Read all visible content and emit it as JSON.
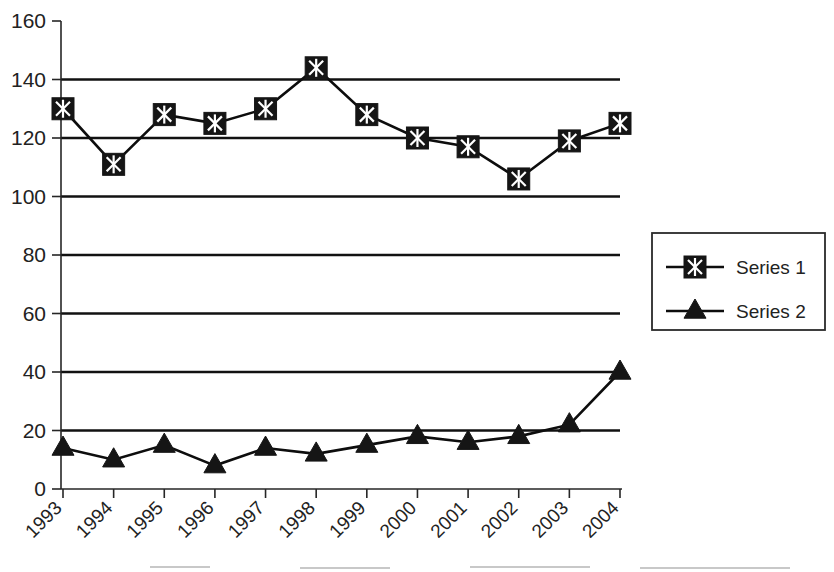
{
  "chart_data": {
    "type": "line",
    "title": "",
    "xlabel": "",
    "ylabel": "",
    "categories": [
      "1993",
      "1994",
      "1995",
      "1996",
      "1997",
      "1998",
      "1999",
      "2000",
      "2001",
      "2002",
      "2003",
      "2004"
    ],
    "series": [
      {
        "name": "Series 1",
        "marker": "filled-square-cross",
        "values": [
          130,
          111,
          128,
          125,
          130,
          144,
          128,
          120,
          117,
          106,
          119,
          125
        ]
      },
      {
        "name": "Series 2",
        "marker": "filled-triangle",
        "values": [
          14,
          10,
          15,
          8,
          14,
          12,
          15,
          18,
          16,
          18,
          22,
          40
        ]
      }
    ],
    "ylim": [
      0,
      160
    ],
    "ytick_values": [
      0,
      20,
      40,
      60,
      80,
      100,
      120,
      140,
      160
    ],
    "ytick_labels": [
      "0",
      "20",
      "40",
      "60",
      "80",
      "100",
      "120",
      "140",
      "160"
    ],
    "gridline_values": [
      20,
      40,
      60,
      80,
      100,
      120,
      140
    ],
    "grid": true,
    "xtick_rotation_degrees": -45,
    "legend": {
      "position": "right",
      "entries": [
        {
          "label": "Series 1",
          "marker": "filled-square-cross"
        },
        {
          "label": "Series 2",
          "marker": "filled-triangle"
        }
      ]
    },
    "colors": {
      "line": "#0d0d0d",
      "marker": "#151515",
      "grid": "#111111",
      "axis": "#262626",
      "background": "#ffffff",
      "text": "#222222"
    }
  }
}
